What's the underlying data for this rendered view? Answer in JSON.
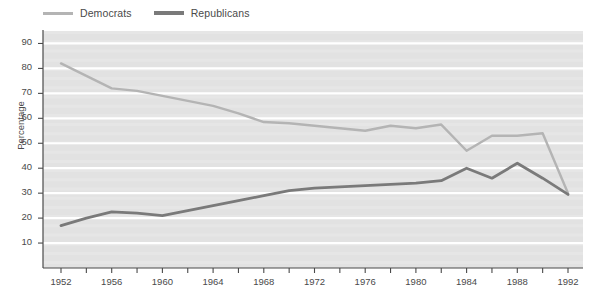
{
  "chart_data": {
    "type": "line",
    "title": "",
    "subtitle": "",
    "xlabel": "",
    "ylabel": "Percentage",
    "xlim": [
      1952,
      1992
    ],
    "ylim": [
      0,
      95
    ],
    "yticks": [
      10,
      20,
      30,
      40,
      50,
      60,
      70,
      80,
      90
    ],
    "xticks": [
      1952,
      1956,
      1960,
      1964,
      1968,
      1972,
      1976,
      1980,
      1984,
      1988,
      1992
    ],
    "xminor_step": 2,
    "grid": "horizontal-white-on-gray",
    "legend_position": "above-plot-left",
    "x": [
      1952,
      1954,
      1956,
      1958,
      1960,
      1962,
      1964,
      1966,
      1968,
      1970,
      1972,
      1974,
      1976,
      1978,
      1980,
      1982,
      1984,
      1986,
      1988,
      1990,
      1992
    ],
    "series": [
      {
        "name": "Democrats",
        "color": "#b4b4b4",
        "values": [
          82,
          77,
          72,
          71,
          69,
          67,
          65,
          62,
          58.5,
          58,
          57,
          56,
          55,
          57,
          56,
          57.5,
          47,
          53,
          53,
          54,
          30
        ]
      },
      {
        "name": "Republicans",
        "color": "#7a7a7a",
        "values": [
          17,
          20,
          22.5,
          22,
          21,
          23,
          25,
          27,
          29,
          31,
          32,
          32.5,
          33,
          33.5,
          34,
          35,
          40,
          36,
          42,
          36,
          29.5
        ]
      }
    ]
  },
  "legend": {
    "items": [
      {
        "label": "Democrats"
      },
      {
        "label": "Republicans"
      }
    ]
  },
  "axes": {
    "y_title": "Percentage"
  },
  "colors": {
    "plot_background": "#e2e2e2",
    "gridline": "#ffffff",
    "axis_line": "#4a4a4a",
    "democrats": "#b4b4b4",
    "republicans": "#7a7a7a"
  }
}
